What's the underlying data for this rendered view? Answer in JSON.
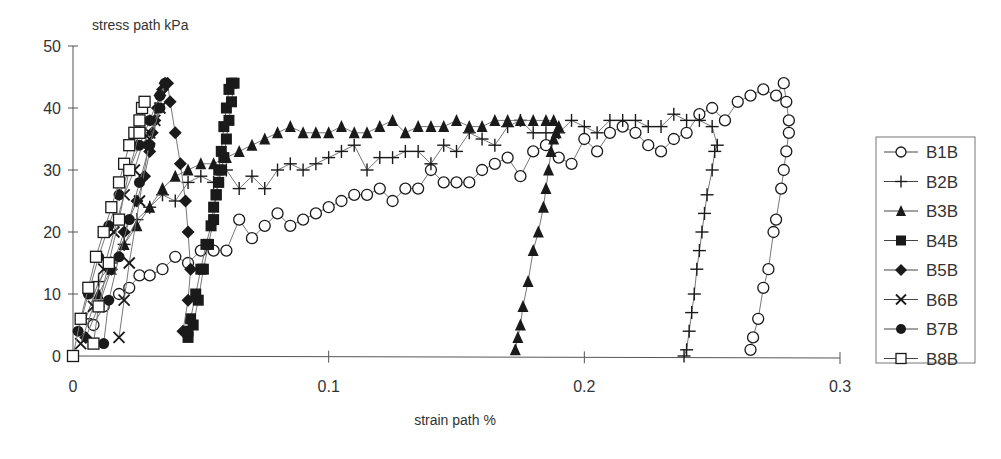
{
  "chart_data": {
    "type": "scatter",
    "title": "",
    "ylabel": "stress path kPa",
    "xlabel": "strain path %",
    "xlim": [
      0,
      0.3
    ],
    "ylim": [
      0,
      50
    ],
    "x_ticks": [
      "0",
      "0.1",
      "0.2",
      "0.3"
    ],
    "y_ticks": [
      "0",
      "10",
      "20",
      "30",
      "40",
      "50"
    ],
    "grid": false,
    "legend_position": "right",
    "series": [
      {
        "name": "B1B",
        "marker": "open-circle",
        "x": [
          0.008,
          0.012,
          0.018,
          0.022,
          0.026,
          0.03,
          0.035,
          0.04,
          0.045,
          0.05,
          0.055,
          0.06,
          0.065,
          0.07,
          0.075,
          0.08,
          0.085,
          0.09,
          0.095,
          0.1,
          0.105,
          0.11,
          0.115,
          0.12,
          0.125,
          0.13,
          0.135,
          0.14,
          0.145,
          0.15,
          0.155,
          0.16,
          0.165,
          0.17,
          0.175,
          0.18,
          0.185,
          0.19,
          0.195,
          0.2,
          0.205,
          0.21,
          0.215,
          0.22,
          0.225,
          0.23,
          0.235,
          0.24,
          0.245,
          0.25,
          0.255,
          0.26,
          0.265,
          0.27,
          0.275,
          0.278,
          0.279,
          0.28,
          0.28,
          0.279,
          0.278,
          0.277,
          0.275,
          0.274,
          0.272,
          0.27,
          0.268,
          0.266,
          0.265
        ],
        "y": [
          5,
          8,
          10,
          11,
          13,
          13,
          14,
          16,
          15,
          17,
          17,
          17,
          22,
          19,
          21,
          23,
          21,
          22,
          23,
          24,
          25,
          26,
          26,
          27,
          25,
          27,
          27,
          30,
          28,
          28,
          28,
          30,
          31,
          32,
          29,
          33,
          34,
          32,
          31,
          35,
          33,
          36,
          37,
          36,
          34,
          33,
          35,
          36,
          39,
          40,
          38,
          41,
          42,
          43,
          42,
          44,
          41,
          38,
          36,
          33,
          30,
          27,
          22,
          20,
          14,
          11,
          6,
          3,
          1
        ]
      },
      {
        "name": "B2B",
        "marker": "plus",
        "x": [
          0.005,
          0.01,
          0.015,
          0.02,
          0.025,
          0.03,
          0.035,
          0.04,
          0.045,
          0.05,
          0.055,
          0.06,
          0.065,
          0.07,
          0.075,
          0.08,
          0.085,
          0.09,
          0.095,
          0.1,
          0.105,
          0.11,
          0.115,
          0.12,
          0.125,
          0.13,
          0.135,
          0.14,
          0.145,
          0.15,
          0.155,
          0.16,
          0.165,
          0.17,
          0.175,
          0.18,
          0.185,
          0.19,
          0.195,
          0.2,
          0.205,
          0.21,
          0.215,
          0.22,
          0.225,
          0.23,
          0.235,
          0.24,
          0.245,
          0.25,
          0.252,
          0.251,
          0.25,
          0.248,
          0.247,
          0.246,
          0.245,
          0.244,
          0.243,
          0.242,
          0.241,
          0.24,
          0.239
        ],
        "y": [
          6,
          12,
          15,
          18,
          22,
          24,
          26,
          25,
          28,
          29,
          28,
          30,
          27,
          29,
          27,
          30,
          31,
          30,
          31,
          32,
          33,
          34,
          30,
          32,
          32,
          33,
          33,
          31,
          34,
          33,
          36,
          35,
          34,
          37,
          38,
          36,
          36,
          36,
          38,
          37,
          36,
          38,
          38,
          38,
          37,
          37,
          39,
          38,
          38,
          37,
          34,
          33,
          30,
          26,
          23,
          20,
          17,
          14,
          10,
          7,
          4,
          1,
          0
        ]
      },
      {
        "name": "B3B",
        "marker": "filled-triangle",
        "x": [
          0.01,
          0.015,
          0.02,
          0.025,
          0.03,
          0.035,
          0.04,
          0.045,
          0.05,
          0.055,
          0.06,
          0.065,
          0.07,
          0.075,
          0.08,
          0.085,
          0.09,
          0.095,
          0.1,
          0.105,
          0.11,
          0.115,
          0.12,
          0.125,
          0.13,
          0.135,
          0.14,
          0.145,
          0.15,
          0.155,
          0.16,
          0.165,
          0.17,
          0.175,
          0.18,
          0.185,
          0.188,
          0.19,
          0.189,
          0.188,
          0.187,
          0.186,
          0.185,
          0.184,
          0.182,
          0.18,
          0.178,
          0.176,
          0.175,
          0.174,
          0.173
        ],
        "y": [
          10,
          14,
          18,
          21,
          24,
          27,
          29,
          30,
          31,
          31,
          32,
          33,
          34,
          35,
          36,
          37,
          36,
          36,
          36,
          37,
          36,
          36,
          37,
          38,
          36,
          37,
          37,
          37,
          38,
          37,
          37,
          38,
          38,
          38,
          38,
          38,
          38,
          37,
          36,
          35,
          33,
          30,
          27,
          24,
          20,
          17,
          12,
          8,
          5,
          3,
          1
        ]
      },
      {
        "name": "B4B",
        "marker": "filled-square",
        "x": [
          0.045,
          0.047,
          0.049,
          0.051,
          0.053,
          0.055,
          0.056,
          0.057,
          0.058,
          0.059,
          0.06,
          0.061,
          0.062,
          0.063,
          0.062,
          0.061,
          0.06,
          0.059,
          0.058,
          0.057,
          0.056,
          0.055,
          0.054,
          0.052,
          0.05,
          0.048,
          0.046,
          0.045
        ],
        "y": [
          3,
          5,
          9,
          14,
          18,
          22,
          26,
          30,
          33,
          37,
          40,
          43,
          44,
          44,
          41,
          38,
          35,
          32,
          30,
          28,
          26,
          24,
          21,
          18,
          14,
          10,
          6,
          4
        ]
      },
      {
        "name": "B5B",
        "marker": "filled-diamond",
        "x": [
          0.005,
          0.01,
          0.015,
          0.02,
          0.025,
          0.028,
          0.03,
          0.031,
          0.032,
          0.033,
          0.034,
          0.035,
          0.036,
          0.037,
          0.038,
          0.04,
          0.042,
          0.044,
          0.045,
          0.046,
          0.045,
          0.043
        ],
        "y": [
          3,
          8,
          14,
          20,
          25,
          29,
          33,
          36,
          38,
          40,
          42,
          43,
          44,
          44,
          41,
          36,
          31,
          25,
          20,
          14,
          9,
          4
        ]
      },
      {
        "name": "B6B",
        "marker": "x-cross",
        "x": [
          0.003,
          0.008,
          0.012,
          0.016,
          0.02,
          0.024,
          0.027,
          0.03,
          0.032,
          0.034,
          0.03,
          0.026,
          0.022,
          0.02,
          0.018
        ],
        "y": [
          2,
          8,
          14,
          20,
          26,
          30,
          34,
          36,
          38,
          40,
          35,
          25,
          15,
          9,
          3
        ]
      },
      {
        "name": "B7B",
        "marker": "filled-circle",
        "x": [
          0.002,
          0.006,
          0.01,
          0.014,
          0.018,
          0.022,
          0.026,
          0.03,
          0.034,
          0.036,
          0.034,
          0.03,
          0.026,
          0.022,
          0.018,
          0.014,
          0.012
        ],
        "y": [
          4,
          10,
          16,
          21,
          26,
          30,
          34,
          38,
          42,
          44,
          40,
          34,
          28,
          22,
          16,
          9,
          2
        ]
      },
      {
        "name": "B8B",
        "marker": "open-square",
        "x": [
          0.0,
          0.003,
          0.006,
          0.009,
          0.012,
          0.015,
          0.018,
          0.02,
          0.022,
          0.024,
          0.026,
          0.027,
          0.028,
          0.026,
          0.022,
          0.018,
          0.014,
          0.01,
          0.008
        ],
        "y": [
          0,
          6,
          11,
          16,
          20,
          24,
          28,
          31,
          34,
          36,
          38,
          40,
          41,
          36,
          30,
          22,
          15,
          8,
          2
        ]
      }
    ]
  },
  "legend": {
    "items": [
      {
        "label": "B1B"
      },
      {
        "label": "B2B"
      },
      {
        "label": "B3B"
      },
      {
        "label": "B4B"
      },
      {
        "label": "B5B"
      },
      {
        "label": "B6B"
      },
      {
        "label": "B7B"
      },
      {
        "label": "B8B"
      }
    ]
  },
  "colors": {
    "ink": "#1a1a1a",
    "axis": "#555555",
    "line": "#777777",
    "background": "#ffffff"
  }
}
